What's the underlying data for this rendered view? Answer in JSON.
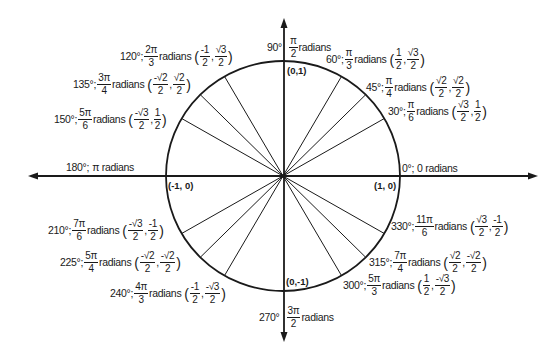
{
  "diagram": {
    "center": {
      "x": 283,
      "y": 176
    },
    "radius": 116,
    "colors": {
      "line": "#1a1a1a",
      "background": "#ffffff"
    },
    "axis_points": {
      "top": "(0,1)",
      "bottom": "(0,-1)",
      "left": "(-1, 0)",
      "right": "(1, 0)"
    },
    "angles": [
      {
        "deg": "0°;",
        "rad_plain": "0 radians"
      },
      {
        "deg": "30°;",
        "rad_num": "π",
        "rad_den": "6",
        "word": "radians",
        "x_num": "√3",
        "x_den": "2",
        "y_num": "1",
        "y_den": "2"
      },
      {
        "deg": "45°;",
        "rad_num": "π",
        "rad_den": "4",
        "word": "radians",
        "x_num": "√2",
        "x_den": "2",
        "y_num": "√2",
        "y_den": "2"
      },
      {
        "deg": "60°;",
        "rad_num": "π",
        "rad_den": "3",
        "word": "radians",
        "x_num": "1",
        "x_den": "2",
        "y_num": "√3",
        "y_den": "2"
      },
      {
        "deg": "90°",
        "rad_num": "π",
        "rad_den": "2",
        "word": "radians"
      },
      {
        "deg": "120°;",
        "rad_num": "2π",
        "rad_den": "3",
        "word": "radians",
        "x_num": "-1",
        "x_den": "2",
        "y_num": "√3",
        "y_den": "2"
      },
      {
        "deg": "135°;",
        "rad_num": "3π",
        "rad_den": "4",
        "word": "radians",
        "x_num": "-√2",
        "x_den": "2",
        "y_num": "√2",
        "y_den": "2"
      },
      {
        "deg": "150°;",
        "rad_num": "5π",
        "rad_den": "6",
        "word": "radians",
        "x_num": "-√3",
        "x_den": "2",
        "y_num": "1",
        "y_den": "2"
      },
      {
        "deg": "180°;",
        "rad_plain": "π radians"
      },
      {
        "deg": "210°;",
        "rad_num": "7π",
        "rad_den": "6",
        "word": "radians",
        "x_num": "-√3",
        "x_den": "2",
        "y_num": "-1",
        "y_den": "2"
      },
      {
        "deg": "225°;",
        "rad_num": "5π",
        "rad_den": "4",
        "word": "radians",
        "x_num": "-√2",
        "x_den": "2",
        "y_num": "-√2",
        "y_den": "2"
      },
      {
        "deg": "240°;",
        "rad_num": "4π",
        "rad_den": "3",
        "word": "radians",
        "x_num": "-1",
        "x_den": "2",
        "y_num": "-√3",
        "y_den": "2"
      },
      {
        "deg": "270°",
        "rad_num": "3π",
        "rad_den": "2",
        "word": "radians"
      },
      {
        "deg": "300°;",
        "rad_num": "5π",
        "rad_den": "3",
        "word": "radians",
        "x_num": "1",
        "x_den": "2",
        "y_num": "-√3",
        "y_den": "2"
      },
      {
        "deg": "315°;",
        "rad_num": "7π",
        "rad_den": "4",
        "word": "radians",
        "x_num": "√2",
        "x_den": "2",
        "y_num": "-√2",
        "y_den": "2"
      },
      {
        "deg": "330°;",
        "rad_num": "11π",
        "rad_den": "6",
        "word": "radians",
        "x_num": "√3",
        "x_den": "2",
        "y_num": "-1",
        "y_den": "2"
      }
    ],
    "punct": {
      "open": "(",
      "comma": ",",
      "close": ")"
    }
  }
}
